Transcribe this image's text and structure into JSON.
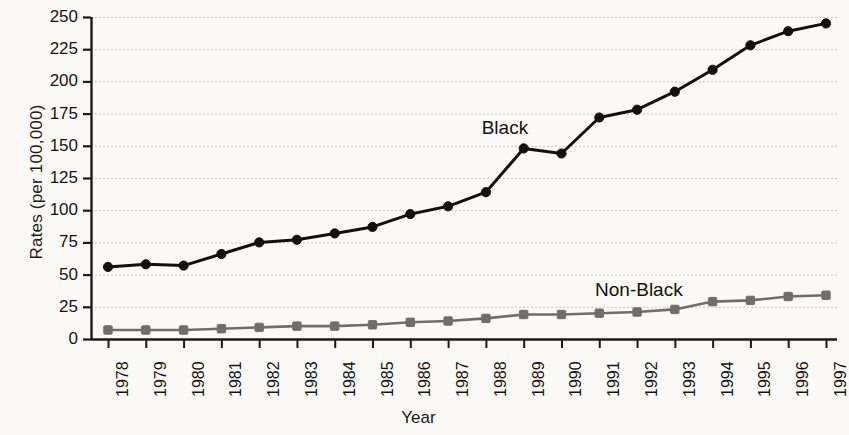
{
  "chart_data": {
    "type": "line",
    "title": "",
    "xlabel": "Year",
    "ylabel": "Rates (per 100,000)",
    "categories": [
      "1978",
      "1979",
      "1980",
      "1981",
      "1982",
      "1983",
      "1984",
      "1985",
      "1986",
      "1987",
      "1988",
      "1989",
      "1990",
      "1991",
      "1992",
      "1993",
      "1994",
      "1995",
      "1996",
      "1997"
    ],
    "x": [
      1978,
      1979,
      1980,
      1981,
      1982,
      1983,
      1984,
      1985,
      1986,
      1987,
      1988,
      1989,
      1990,
      1991,
      1992,
      1993,
      1994,
      1995,
      1996,
      1997
    ],
    "ylim": [
      0,
      250
    ],
    "xlim": [
      1978,
      1997
    ],
    "yticks": [
      0,
      25,
      50,
      75,
      100,
      125,
      150,
      175,
      200,
      225,
      250
    ],
    "ytick_labels": [
      "0",
      "25",
      "50",
      "75",
      "100",
      "125",
      "150",
      "175",
      "200",
      "225",
      "250"
    ],
    "grid": true,
    "grid_axis": "y",
    "grid_style": "dotted",
    "legend": "inline-annotations",
    "series": [
      {
        "name": "Black",
        "color": "#111111",
        "marker": "circle",
        "values": [
          56,
          58,
          57,
          66,
          75,
          77,
          82,
          87,
          97,
          103,
          114,
          148,
          144,
          172,
          178,
          192,
          209,
          228,
          239,
          245
        ]
      },
      {
        "name": "Non-Black",
        "color": "#6e6e6e",
        "marker": "square",
        "values": [
          7,
          7,
          7,
          8,
          9,
          10,
          10,
          11,
          13,
          14,
          16,
          19,
          19,
          20,
          21,
          23,
          29,
          30,
          33,
          34
        ]
      }
    ],
    "annotations": [
      {
        "text": "Black",
        "x": 1989,
        "y": 164
      },
      {
        "text": "Non-Black",
        "x": 1992,
        "y": 38
      }
    ]
  },
  "style": {
    "background": "#fbfaf6",
    "axis_color": "#1a1a1a",
    "grid_color": "#b9b6ac",
    "black_series_color": "#111111",
    "nonblack_series_color": "#6e6e6e"
  }
}
